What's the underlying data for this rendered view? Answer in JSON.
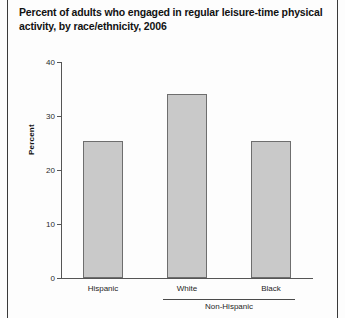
{
  "chart_data": {
    "type": "bar",
    "title": "Percent of adults who engaged in regular leisure-time physical activity, by race/ethnicity, 2006",
    "title_line1": "Percent of adults who engaged in regular leisure-time physical",
    "title_line2": "activity, by race/ethnicity, 2006",
    "categories": [
      "Hispanic",
      "White",
      "Black"
    ],
    "values": [
      25.3,
      34.0,
      25.4
    ],
    "xlabel": "",
    "ylabel": "Percent",
    "ylim": [
      0,
      40
    ],
    "yticks": [
      0,
      10,
      20,
      30,
      40
    ],
    "ytick_labels": [
      "0",
      "10",
      "20",
      "30",
      "40"
    ],
    "grid": false,
    "legend": false,
    "group_bracket": {
      "label": "Non-Hispanic",
      "covers": [
        "White",
        "Black"
      ]
    },
    "bar_fill_color": "#c9c9c9",
    "bar_border_color": "#6e6e6e",
    "axis_color": "#555555"
  }
}
